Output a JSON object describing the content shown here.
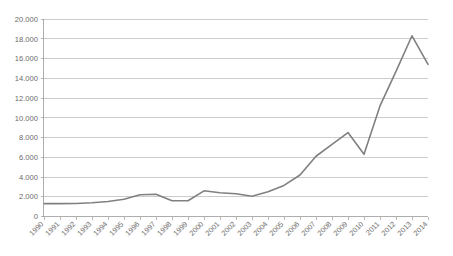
{
  "chart_data": {
    "type": "line",
    "title": "",
    "subtitle": "",
    "xlabel": "",
    "ylabel": "",
    "grid": "horizontal",
    "legend": "none",
    "xlim": [
      1990,
      2014
    ],
    "ylim": [
      0,
      20000
    ],
    "categories": [
      "1990",
      "1991",
      "1992",
      "1993",
      "1994",
      "1995",
      "1996",
      "1997",
      "1998",
      "1999",
      "2000",
      "2001",
      "2002",
      "2003",
      "2004",
      "2005",
      "2006",
      "2007",
      "2008",
      "2009",
      "2010",
      "2011",
      "2012",
      "2013",
      "2014"
    ],
    "values": [
      1300,
      1300,
      1320,
      1400,
      1520,
      1750,
      2200,
      2250,
      1600,
      1600,
      2600,
      2400,
      2300,
      2050,
      2500,
      3150,
      4200,
      6100,
      7300,
      8500,
      6300,
      11200,
      14700,
      18300,
      15400
    ],
    "series": [
      {
        "name": "series-1",
        "color": "#808080",
        "values": [
          1300,
          1300,
          1320,
          1400,
          1520,
          1750,
          2200,
          2250,
          1600,
          1600,
          2600,
          2400,
          2300,
          2050,
          2500,
          3150,
          4200,
          6100,
          7300,
          8500,
          6300,
          11200,
          14700,
          18300,
          15400
        ]
      }
    ],
    "y_ticks": [
      0,
      2000,
      4000,
      6000,
      8000,
      10000,
      12000,
      14000,
      16000,
      18000,
      20000
    ],
    "y_tick_labels": [
      "0",
      "2.000",
      "4.000",
      "6.000",
      "8.000",
      "10.000",
      "12.000",
      "14.000",
      "16.000",
      "18.000",
      "20.000"
    ],
    "x_tick_labels": [
      "1990",
      "1991",
      "1992",
      "1993",
      "1994",
      "1995",
      "1996",
      "1997",
      "1998",
      "1999",
      "2000",
      "2001",
      "2002",
      "2003",
      "2004",
      "2005",
      "2006",
      "2007",
      "2008",
      "2009",
      "2010",
      "2011",
      "2012",
      "2013",
      "2014"
    ],
    "x_tick_rotation": -45,
    "colors": {
      "line": "#808080",
      "gridline": "#b7b7b7",
      "axis": "#9a9a9a",
      "tick_text": "#6b6b6b",
      "background": "#ffffff"
    }
  }
}
